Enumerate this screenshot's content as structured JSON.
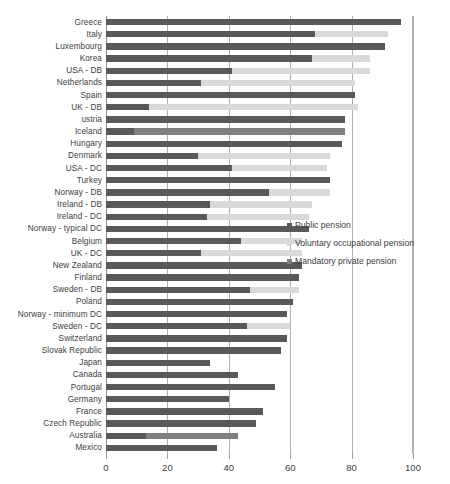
{
  "chart_data": {
    "type": "bar",
    "orientation": "horizontal",
    "stacked": true,
    "title": "",
    "xlabel": "",
    "ylabel": "",
    "xlim": [
      0,
      100
    ],
    "xticks": [
      0,
      20,
      40,
      60,
      80,
      100
    ],
    "grid": true,
    "legend_position": "center-right",
    "categories": [
      "Greece",
      "Italy",
      "Luxembourg",
      "Korea",
      "USA - DB",
      "Netherlands",
      "Spain",
      "UK - DB",
      "ustria",
      "Iceland",
      "Hungary",
      "Denmark",
      "USA - DC",
      "Turkey",
      "Norway - DB",
      "Ireland - DB",
      "Ireland - DC",
      "Norway - typical DC",
      "Belgium",
      "UK - DC",
      "New Zealand",
      "Finland",
      "Sweden - DB",
      "Poland",
      "Norway - minimum DC",
      "Sweden - DC",
      "Switzerland",
      "Slovak Republic",
      "Japan",
      "Canada",
      "Portugal",
      "Germany",
      "France",
      "Czech Republic",
      "Australia",
      "Mexico"
    ],
    "series": [
      {
        "name": "Public pension",
        "color": "#595959",
        "values": [
          96,
          68,
          91,
          67,
          41,
          31,
          81,
          14,
          78,
          9,
          77,
          30,
          41,
          73,
          53,
          34,
          33,
          66,
          44,
          31,
          64,
          63,
          47,
          61,
          59,
          46,
          59,
          57,
          34,
          43,
          55,
          40,
          51,
          49,
          13,
          36
        ]
      },
      {
        "name": "Voluntary occupational pension",
        "color": "#d9d9d9",
        "values": [
          0,
          24,
          0,
          19,
          45,
          50,
          0,
          68,
          0,
          0,
          0,
          43,
          31,
          0,
          20,
          33,
          33,
          0,
          20,
          33,
          0,
          0,
          16,
          0,
          0,
          14,
          0,
          0,
          0,
          0,
          0,
          0,
          0,
          0,
          0,
          0
        ]
      },
      {
        "name": "Mandatory private pension",
        "color": "#7f7f7f",
        "values": [
          0,
          0,
          0,
          0,
          0,
          0,
          0,
          0,
          0,
          69,
          0,
          0,
          0,
          0,
          0,
          0,
          0,
          0,
          0,
          0,
          0,
          0,
          0,
          0,
          0,
          0,
          0,
          0,
          0,
          0,
          0,
          0,
          0,
          0,
          30,
          0
        ]
      }
    ]
  },
  "legend": {
    "items": [
      {
        "label": "Public pension",
        "key": "public"
      },
      {
        "label": "Voluntary occupational pension",
        "key": "voluntary"
      },
      {
        "label": "Mandatory private pension",
        "key": "mandatory"
      }
    ]
  },
  "colors": {
    "public": "#595959",
    "voluntary": "#d9d9d9",
    "mandatory": "#7f7f7f",
    "grid": "#b0b0b0",
    "text": "#3d3d3d",
    "background": "#ffffff"
  }
}
